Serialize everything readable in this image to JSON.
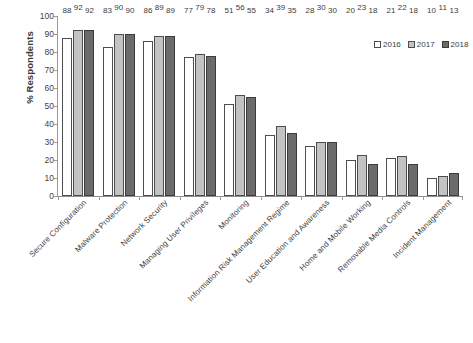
{
  "chart_data": {
    "type": "bar",
    "title": "",
    "subtitle": "",
    "xlabel": "",
    "ylabel": "% Respondents",
    "ylim": [
      0,
      100
    ],
    "ytick_step": 10,
    "yticks": [
      0,
      10,
      20,
      30,
      40,
      50,
      60,
      70,
      80,
      90,
      100
    ],
    "grid": false,
    "legend_position": "top-right",
    "categories": [
      "Secure Configuration",
      "Malware Protection",
      "Network Security",
      "Managing User Privileges",
      "Monitoring",
      "Information Risk Management Regime",
      "User Education and Awareness",
      "Home and Mobile Working",
      "Removable Media Controls",
      "Incident Management"
    ],
    "series": [
      {
        "name": "2016",
        "color": "#ffffff",
        "values": [
          88,
          83,
          86,
          77,
          51,
          34,
          28,
          20,
          21,
          10
        ]
      },
      {
        "name": "2017",
        "color": "#c3c3c3",
        "values": [
          92,
          90,
          89,
          79,
          56,
          39,
          30,
          23,
          22,
          11
        ]
      },
      {
        "name": "2018",
        "color": "#6b6b6b",
        "values": [
          92,
          90,
          89,
          78,
          55,
          35,
          30,
          18,
          18,
          13
        ]
      }
    ],
    "data_labels_shown": true
  }
}
